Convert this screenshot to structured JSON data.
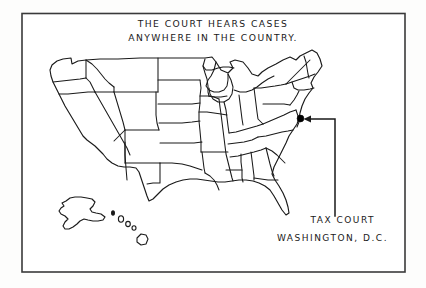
{
  "illustration": {
    "kind": "cartoon-map-illustration",
    "background_color": "#fdfdfc",
    "ink_color": "#1a1a1a",
    "frame_color": "#3a3a3a",
    "title_line_1": "THE COURT HEARS CASES",
    "title_line_2": "ANYWHERE IN THE COUNTRY.",
    "label_line_1": "TAX COURT",
    "label_line_2": "WASHINGTON, D.C.",
    "marker_name": "washington-dc-marker",
    "arrow_name": "leader-arrow-to-dc"
  },
  "map": {
    "region_label": "united-states",
    "insets": [
      "alaska",
      "hawaii"
    ],
    "marker_color": "#000000"
  }
}
